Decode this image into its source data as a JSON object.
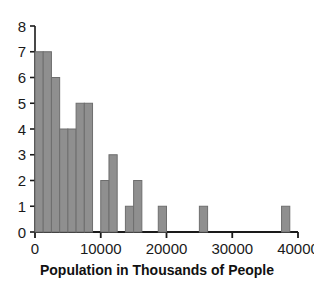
{
  "chart_data": {
    "type": "bar",
    "title": "",
    "xlabel": "Population in Thousands of People",
    "ylabel": "",
    "xlim": [
      0,
      40000
    ],
    "ylim": [
      0,
      8
    ],
    "grid": false,
    "legend": null,
    "bin_width": 1250,
    "x_ticks": [
      0,
      10000,
      20000,
      30000,
      40000
    ],
    "x_tick_labels": [
      "0",
      "10000",
      "20000",
      "30000",
      "40000"
    ],
    "y_ticks": [
      0,
      1,
      2,
      3,
      4,
      5,
      6,
      7,
      8
    ],
    "y_tick_labels": [
      "0",
      "1",
      "2",
      "3",
      "4",
      "5",
      "6",
      "7",
      "8"
    ],
    "bars": [
      {
        "x0": 0,
        "x1": 1250,
        "value": 7
      },
      {
        "x0": 1250,
        "x1": 2500,
        "value": 7
      },
      {
        "x0": 2500,
        "x1": 3750,
        "value": 6
      },
      {
        "x0": 3750,
        "x1": 5000,
        "value": 4
      },
      {
        "x0": 5000,
        "x1": 6250,
        "value": 4
      },
      {
        "x0": 6250,
        "x1": 7500,
        "value": 5
      },
      {
        "x0": 7500,
        "x1": 8750,
        "value": 5
      },
      {
        "x0": 10000,
        "x1": 11250,
        "value": 2
      },
      {
        "x0": 11250,
        "x1": 12500,
        "value": 3
      },
      {
        "x0": 13750,
        "x1": 15000,
        "value": 1
      },
      {
        "x0": 15000,
        "x1": 16250,
        "value": 2
      },
      {
        "x0": 18750,
        "x1": 20000,
        "value": 1
      },
      {
        "x0": 25000,
        "x1": 26250,
        "value": 1
      },
      {
        "x0": 37500,
        "x1": 38750,
        "value": 1
      }
    ],
    "colors": {
      "bar_fill": "#8f8f8f",
      "bar_stroke": "#6e6e6e",
      "axis": "#1a1a1a",
      "background": "#ffffff",
      "text": "#111111"
    }
  }
}
